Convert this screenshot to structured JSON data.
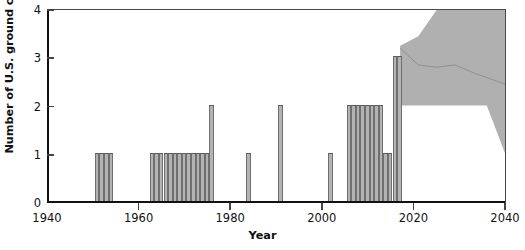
{
  "chart_data": {
    "type": "bar",
    "title": "",
    "xlabel": "Year",
    "ylabel": "Number of U.S. ground combat missions",
    "xlim": [
      1940,
      2040
    ],
    "ylim": [
      0,
      4
    ],
    "grid": false,
    "legend": "none",
    "bar_width_years": 1,
    "x_ticks": [
      1940,
      1960,
      1980,
      2000,
      2020,
      2040
    ],
    "x_tick_labels": [
      "1940",
      "1960",
      "1980",
      "2000",
      "2020",
      "2040"
    ],
    "y_ticks": [
      0,
      1,
      2,
      3,
      4
    ],
    "y_tick_labels": [
      "0",
      "1",
      "2",
      "3",
      "4"
    ],
    "bar_color": "#b3b3b3",
    "bar_edge_color": "#6f6f6f",
    "band_color": "#b0b0b0",
    "axis_color": "#111111",
    "x": [
      1950,
      1951,
      1952,
      1953,
      1962,
      1963,
      1964,
      1965,
      1966,
      1967,
      1968,
      1969,
      1970,
      1971,
      1972,
      1973,
      1974,
      1975,
      1983,
      1990,
      2001,
      2005,
      2006,
      2007,
      2008,
      2009,
      2010,
      2011,
      2012,
      2013,
      2014,
      2015,
      2016,
      2040
    ],
    "values": [
      1,
      1,
      1,
      1,
      1,
      1,
      1,
      1,
      1,
      1,
      1,
      1,
      1,
      1,
      1,
      1,
      1,
      2,
      1,
      2,
      1,
      2,
      2,
      2,
      2,
      2,
      2,
      2,
      2,
      1,
      1,
      3,
      3,
      1
    ],
    "projection_band": {
      "label": "projection uncertainty band",
      "start_year": 2017,
      "end_year": 2040,
      "upper": [
        {
          "year": 2017,
          "value": 3.25
        },
        {
          "year": 2021,
          "value": 3.45
        },
        {
          "year": 2025,
          "value": 4.0
        },
        {
          "year": 2040,
          "value": 4.0
        }
      ],
      "lower": [
        {
          "year": 2017,
          "value": 2.0
        },
        {
          "year": 2036,
          "value": 2.0
        },
        {
          "year": 2040,
          "value": 1.0
        }
      ],
      "median_line": [
        {
          "year": 2017,
          "value": 3.2
        },
        {
          "year": 2021,
          "value": 2.85
        },
        {
          "year": 2025,
          "value": 2.8
        },
        {
          "year": 2029,
          "value": 2.85
        },
        {
          "year": 2034,
          "value": 2.65
        },
        {
          "year": 2040,
          "value": 2.45
        }
      ]
    }
  }
}
